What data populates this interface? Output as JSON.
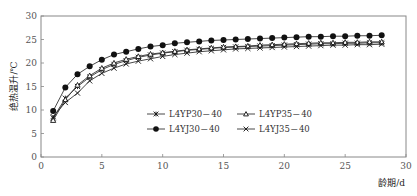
{
  "chart_data": {
    "type": "line",
    "title": "",
    "xlabel": "龄期/d",
    "ylabel": "绝热温升/℃",
    "xlim": [
      0,
      30
    ],
    "ylim": [
      0,
      30
    ],
    "xticks": [
      0,
      5,
      10,
      15,
      20,
      25,
      30
    ],
    "yticks": [
      0,
      5,
      10,
      15,
      20,
      25,
      30
    ],
    "grid": false,
    "legend_position": "inside-center",
    "x": [
      1,
      2,
      3,
      4,
      5,
      6,
      7,
      8,
      9,
      10,
      11,
      12,
      13,
      14,
      15,
      16,
      17,
      18,
      19,
      20,
      21,
      22,
      23,
      24,
      25,
      26,
      27,
      28
    ],
    "series": [
      {
        "name": "L4YP30－40",
        "marker": "asterisk",
        "values": [
          8.3,
          12.5,
          15.0,
          17.0,
          18.6,
          19.7,
          20.5,
          21.2,
          21.7,
          22.1,
          22.4,
          22.7,
          22.9,
          23.1,
          23.3,
          23.4,
          23.5,
          23.6,
          23.7,
          23.8,
          23.9,
          24.0,
          24.1,
          24.1,
          24.2,
          24.2,
          24.3,
          24.3
        ]
      },
      {
        "name": "L4YP35－40",
        "marker": "triangle-open",
        "values": [
          7.8,
          12.2,
          15.3,
          17.3,
          18.9,
          20.0,
          20.8,
          21.4,
          21.9,
          22.2,
          22.5,
          22.8,
          23.0,
          23.2,
          23.4,
          23.5,
          23.6,
          23.8,
          23.9,
          24.0,
          24.1,
          24.2,
          24.3,
          24.3,
          24.4,
          24.4,
          24.5,
          24.5
        ]
      },
      {
        "name": "L4YJ30－40",
        "marker": "circle-filled",
        "values": [
          9.8,
          14.8,
          17.6,
          19.3,
          20.7,
          21.8,
          22.4,
          23.0,
          23.5,
          23.8,
          24.2,
          24.4,
          24.6,
          24.8,
          24.9,
          25.0,
          25.1,
          25.2,
          25.3,
          25.4,
          25.5,
          25.6,
          25.6,
          25.7,
          25.7,
          25.8,
          25.8,
          25.9
        ]
      },
      {
        "name": "L4YJ35－40",
        "marker": "x",
        "values": [
          8.6,
          11.6,
          13.6,
          16.2,
          17.8,
          18.9,
          19.8,
          20.4,
          20.9,
          21.4,
          21.8,
          22.1,
          22.4,
          22.6,
          22.8,
          23.0,
          23.1,
          23.2,
          23.3,
          23.4,
          23.5,
          23.6,
          23.7,
          23.8,
          23.8,
          23.9,
          23.9,
          24.0
        ]
      }
    ]
  },
  "axes": {
    "xlabel": "龄期/d",
    "ylabel": "绝热温升/℃"
  },
  "legend": {
    "items": [
      {
        "label": "L4YP30－40",
        "marker": "asterisk"
      },
      {
        "label": "L4YP35－40",
        "marker": "triangle-open"
      },
      {
        "label": "L4YJ30－40",
        "marker": "circle-filled"
      },
      {
        "label": "L4YJ35－40",
        "marker": "x"
      }
    ]
  },
  "colors": {
    "axis": "#888888",
    "line": "#333333",
    "marker": "#111111"
  }
}
